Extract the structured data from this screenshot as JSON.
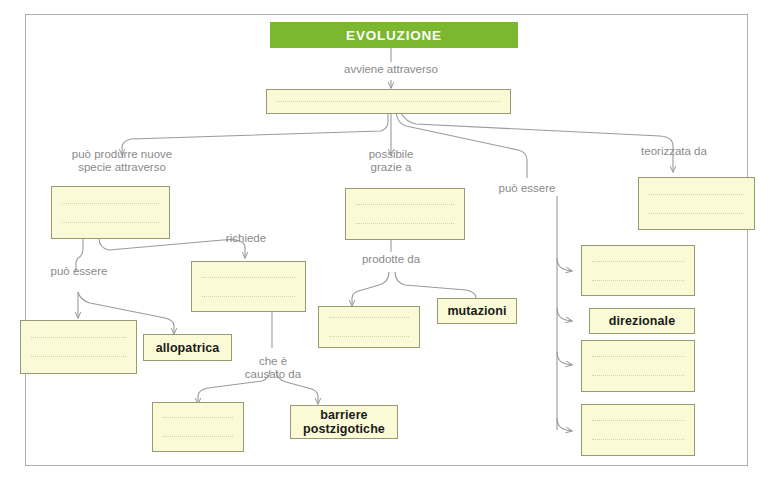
{
  "diagram": {
    "title": "EVOLUZIONE",
    "language": "it",
    "kind": "concept-map-fill-in-the-blanks",
    "colors": {
      "header_green": "#7bb82f",
      "node_fill": "#fafad7",
      "node_border": "#9a9a72",
      "connector": "#9a9a9a",
      "label_text": "#8a8a8a",
      "frame_border": "#b0b0b0"
    },
    "header": {
      "label": "EVOLUZIONE"
    },
    "connector_labels": [
      {
        "id": "avviene-attraverso",
        "text": "avviene attraverso"
      },
      {
        "id": "puo-produrre-nuove-specie-attraverso",
        "text": "può produrre nuove\nspecie attraverso"
      },
      {
        "id": "possibile-grazie-a",
        "text": "possibile\ngrazie a"
      },
      {
        "id": "puo-essere-right",
        "text": "può essere"
      },
      {
        "id": "teorizzata-da",
        "text": "teorizzata da"
      },
      {
        "id": "richiede",
        "text": "richiede"
      },
      {
        "id": "puo-essere-left",
        "text": "può essere"
      },
      {
        "id": "prodotte-da",
        "text": "prodotte da"
      },
      {
        "id": "che-e-causato-da",
        "text": "che è\ncausato da"
      }
    ],
    "nodes": [
      {
        "id": "main-mechanism",
        "label": "",
        "blank": true,
        "lines": 1
      },
      {
        "id": "speciation",
        "label": "",
        "blank": true,
        "lines": 2
      },
      {
        "id": "speciation-type-blank",
        "label": "",
        "blank": true,
        "lines": 2
      },
      {
        "id": "allopatrica",
        "label": "allopatrica",
        "blank": false,
        "lines": 0
      },
      {
        "id": "richiede-target",
        "label": "",
        "blank": true,
        "lines": 2
      },
      {
        "id": "causato-da-blank",
        "label": "",
        "blank": true,
        "lines": 2
      },
      {
        "id": "barriere-postzigotiche",
        "label": "barriere\npostzigotiche",
        "blank": false,
        "lines": 0
      },
      {
        "id": "variability",
        "label": "",
        "blank": true,
        "lines": 2
      },
      {
        "id": "prodotte-da-blank",
        "label": "",
        "blank": true,
        "lines": 2
      },
      {
        "id": "mutazioni",
        "label": "mutazioni",
        "blank": false,
        "lines": 0
      },
      {
        "id": "teorizzata-da-blank",
        "label": "",
        "blank": true,
        "lines": 2
      },
      {
        "id": "selezione-1",
        "label": "",
        "blank": true,
        "lines": 2
      },
      {
        "id": "direzionale",
        "label": "direzionale",
        "blank": false,
        "lines": 0
      },
      {
        "id": "selezione-3",
        "label": "",
        "blank": true,
        "lines": 2
      },
      {
        "id": "selezione-4",
        "label": "",
        "blank": true,
        "lines": 2
      }
    ]
  }
}
